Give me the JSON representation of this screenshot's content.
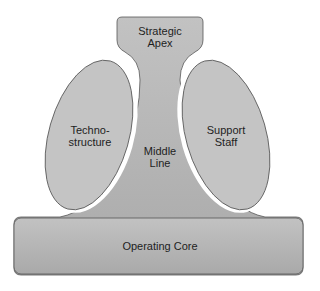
{
  "diagram": {
    "type": "mintzberg-organization-structure",
    "parts": {
      "strategic_apex": {
        "line1": "Strategic",
        "line2": "Apex"
      },
      "technostructure": {
        "line1": "Techno-",
        "line2": "structure"
      },
      "middle_line": {
        "line1": "Middle",
        "line2": "Line"
      },
      "support_staff": {
        "line1": "Support",
        "line2": "Staff"
      },
      "operating_core": {
        "label": "Operating Core"
      }
    },
    "colors": {
      "fill_main": "#b4b4b4",
      "fill_ellipse": "#c4c4c4",
      "stroke": "#555555",
      "text": "#1e1e1e",
      "background": "#ffffff"
    }
  }
}
